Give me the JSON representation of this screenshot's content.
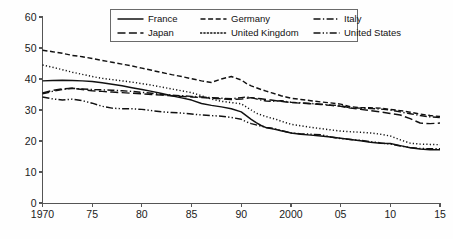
{
  "chart_data": {
    "type": "line",
    "title": "",
    "subtitle": "",
    "xlabel": "",
    "ylabel": "",
    "xlim": [
      1970,
      2015
    ],
    "ylim": [
      0,
      60
    ],
    "grid": false,
    "legend_position": "top-center",
    "y_ticks": [
      "0",
      "10",
      "20",
      "30",
      "40",
      "50",
      "60"
    ],
    "y_tick_values": [
      0,
      10,
      20,
      30,
      40,
      50,
      60
    ],
    "x_ticks": [
      "1970",
      "75",
      "80",
      "85",
      "90",
      "2000",
      "05",
      "10",
      "15"
    ],
    "x_tick_values": [
      1970,
      1975,
      1980,
      1985,
      1990,
      2000,
      2005,
      2010,
      2015
    ],
    "x": [
      1970,
      1971,
      1972,
      1973,
      1974,
      1975,
      1976,
      1977,
      1978,
      1979,
      1980,
      1981,
      1982,
      1983,
      1984,
      1985,
      1986,
      1987,
      1988,
      1989,
      1990,
      1991,
      1992,
      1993,
      1994,
      1995,
      1996,
      1997,
      1998,
      1999,
      2000,
      2001,
      2002,
      2003,
      2004,
      2005,
      2006,
      2007,
      2008,
      2009,
      2010,
      2011,
      2012,
      2013,
      2014,
      2015
    ],
    "series": [
      {
        "name": "France",
        "style": "solid",
        "values": [
          39.4,
          39.5,
          39.6,
          39.5,
          39.4,
          39.2,
          38.8,
          38.3,
          37.8,
          37.2,
          36.6,
          36.0,
          35.3,
          34.6,
          33.9,
          33.2,
          32.1,
          31.5,
          31.0,
          30.4,
          29.4,
          28.2,
          27.0,
          25.9,
          25.0,
          24.3,
          24.0,
          23.7,
          23.3,
          23.0,
          22.6,
          22.2,
          21.9,
          21.6,
          21.3,
          20.9,
          20.5,
          20.1,
          19.6,
          19.3,
          19.2,
          18.5,
          17.8,
          17.4,
          17.2,
          17.2
        ]
      },
      {
        "name": "Germany",
        "style": "dashed-short",
        "values": [
          49.3,
          48.8,
          48.3,
          47.6,
          47.2,
          46.6,
          46.0,
          45.4,
          44.8,
          44.2,
          43.5,
          42.8,
          42.1,
          41.4,
          40.8,
          40.1,
          39.4,
          38.9,
          40.0,
          40.8,
          39.7,
          38.6,
          37.8,
          37.2,
          36.6,
          36.1,
          35.6,
          35.1,
          34.6,
          34.2,
          33.8,
          33.4,
          33.0,
          32.6,
          32.3,
          31.9,
          31.0,
          30.8,
          30.7,
          30.6,
          30.2,
          29.8,
          29.3,
          28.7,
          28.2,
          27.9
        ]
      },
      {
        "name": "Italy",
        "style": "dashdot",
        "values": [
          35.2,
          36.0,
          36.6,
          37.0,
          36.8,
          36.6,
          36.5,
          36.4,
          36.2,
          36.0,
          35.7,
          35.4,
          35.0,
          34.8,
          34.6,
          34.4,
          34.2,
          34.0,
          33.8,
          33.6,
          34.0,
          34.2,
          34.0,
          33.6,
          33.2,
          32.9,
          32.8,
          32.9,
          33.0,
          32.8,
          32.5,
          32.3,
          32.1,
          31.9,
          31.6,
          31.4,
          30.7,
          30.6,
          30.5,
          30.3,
          30.0,
          29.4,
          28.8,
          28.2,
          27.8,
          27.6
        ]
      },
      {
        "name": "Japan",
        "style": "dashed-long",
        "values": [
          35.5,
          36.3,
          36.8,
          37.0,
          36.6,
          36.2,
          36.0,
          35.8,
          35.6,
          35.4,
          35.2,
          35.0,
          34.8,
          34.6,
          34.4,
          34.2,
          34.0,
          33.8,
          33.6,
          33.4,
          33.5,
          33.8,
          34.0,
          33.8,
          33.6,
          33.4,
          33.2,
          33.0,
          32.8,
          32.6,
          32.4,
          32.2,
          32.0,
          31.8,
          31.5,
          31.2,
          30.6,
          30.2,
          29.8,
          29.4,
          28.9,
          28.4,
          27.2,
          25.8,
          25.6,
          25.8
        ]
      },
      {
        "name": "United Kingdom",
        "style": "dotted",
        "values": [
          44.5,
          43.8,
          43.0,
          42.2,
          41.5,
          40.8,
          40.2,
          39.8,
          39.4,
          39.0,
          38.5,
          38.0,
          37.4,
          36.8,
          36.2,
          35.6,
          34.6,
          33.5,
          32.8,
          32.4,
          32.0,
          31.0,
          30.0,
          29.0,
          28.4,
          27.9,
          27.4,
          27.0,
          26.4,
          25.9,
          25.4,
          24.9,
          24.4,
          24.0,
          23.6,
          23.2,
          23.0,
          22.8,
          22.6,
          22.2,
          21.6,
          20.4,
          19.3,
          19.0,
          18.9,
          18.8
        ]
      },
      {
        "name": "United States",
        "style": "dash-dotdot",
        "values": [
          34.2,
          33.6,
          33.2,
          33.5,
          33.0,
          32.2,
          31.2,
          30.6,
          30.4,
          30.4,
          30.2,
          29.8,
          29.4,
          29.2,
          29.0,
          28.7,
          28.4,
          28.2,
          28.0,
          27.6,
          27.0,
          26.2,
          25.6,
          25.2,
          24.8,
          24.4,
          24.2,
          23.8,
          23.4,
          23.0,
          22.6,
          22.3,
          22.2,
          22.0,
          21.3,
          20.8,
          20.5,
          20.2,
          19.8,
          19.4,
          19.0,
          18.4,
          17.9,
          17.6,
          17.5,
          17.5
        ]
      }
    ]
  },
  "legend": {
    "entries": [
      {
        "label": "France",
        "style": "solid",
        "icon": "legend-line-solid-icon"
      },
      {
        "label": "Germany",
        "style": "dashed-short",
        "icon": "legend-line-dashed-short-icon"
      },
      {
        "label": "Italy",
        "style": "dashdot",
        "icon": "legend-line-dashdot-icon"
      },
      {
        "label": "Japan",
        "style": "dashed-long",
        "icon": "legend-line-dashed-long-icon"
      },
      {
        "label": "United Kingdom",
        "style": "dotted",
        "icon": "legend-line-dotted-icon"
      },
      {
        "label": "United States",
        "style": "dash-dotdot",
        "icon": "legend-line-dash-dotdot-icon"
      }
    ]
  },
  "colors": {
    "line": "#111111",
    "axis": "#555555",
    "background": "#fefefe",
    "legend_border": "#6a6a6a"
  }
}
